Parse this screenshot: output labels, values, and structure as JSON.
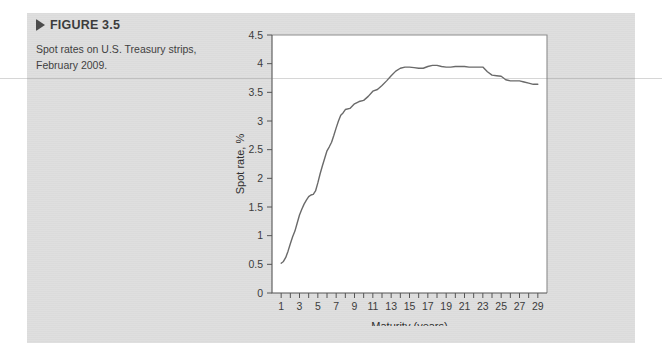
{
  "figure": {
    "marker_icon": "triangle-right-icon",
    "label": "FIGURE 3.5",
    "caption": "Spot rates on U.S. Treasury strips, February 2009."
  },
  "colors": {
    "panel_background": "#dedede",
    "page_background": "#ffffff",
    "plot_background": "#ffffff",
    "line_color": "#6a6a6a",
    "axis_color": "#555555",
    "frame_color": "#8d8d8d",
    "text_color": "#3c3c3c",
    "heading_color": "#3c3c3c"
  },
  "chart_data": {
    "type": "line",
    "title": "",
    "xlabel": "Maturity (years)",
    "ylabel": "Spot rate, %",
    "xlim": [
      0,
      30
    ],
    "ylim": [
      0,
      4.5
    ],
    "ytick_values": [
      0,
      0.5,
      1,
      1.5,
      2,
      2.5,
      3,
      3.5,
      4,
      4.5
    ],
    "ytick_labels": [
      "0",
      "0.5",
      "1",
      "1.5",
      "2",
      "2.5",
      "3",
      "3.5",
      "4",
      "4.5"
    ],
    "xtick_values": [
      1,
      2,
      3,
      4,
      5,
      6,
      7,
      8,
      9,
      10,
      11,
      12,
      13,
      14,
      15,
      16,
      17,
      18,
      19,
      20,
      21,
      22,
      23,
      24,
      25,
      26,
      27,
      28,
      29
    ],
    "xtick_labels": [
      "1",
      "",
      "3",
      "",
      "5",
      "",
      "7",
      "",
      "9",
      "",
      "11",
      "",
      "13",
      "",
      "15",
      "",
      "17",
      "",
      "19",
      "",
      "21",
      "",
      "23",
      "",
      "25",
      "",
      "27",
      "",
      "29"
    ],
    "xtick_labeled_values": [
      1,
      3,
      5,
      7,
      9,
      11,
      13,
      15,
      17,
      19,
      21,
      23,
      25,
      27,
      29
    ],
    "grid": false,
    "legend": "none",
    "series": [
      {
        "name": "U.S. Treasury strip spot rates, February 2009",
        "x": [
          1,
          1.25,
          1.5,
          1.75,
          2,
          2.25,
          2.5,
          2.75,
          3,
          3.25,
          3.5,
          3.75,
          4,
          4.25,
          4.5,
          4.75,
          5,
          5.25,
          5.5,
          5.75,
          6,
          6.25,
          6.5,
          6.75,
          7,
          7.25,
          7.5,
          7.75,
          8,
          8.5,
          9,
          9.5,
          10,
          10.5,
          11,
          11.5,
          12,
          12.5,
          13,
          13.5,
          14,
          14.5,
          15,
          15.5,
          16,
          16.5,
          17,
          17.5,
          18,
          18.5,
          19,
          19.5,
          20,
          20.5,
          21,
          21.5,
          22,
          22.5,
          23,
          23.5,
          24,
          24.5,
          25,
          25.5,
          26,
          26.5,
          27,
          27.5,
          28,
          28.5,
          29
        ],
        "y": [
          0.52,
          0.55,
          0.62,
          0.73,
          0.86,
          0.98,
          1.08,
          1.22,
          1.36,
          1.46,
          1.55,
          1.62,
          1.68,
          1.71,
          1.72,
          1.78,
          1.92,
          2.08,
          2.22,
          2.35,
          2.48,
          2.55,
          2.63,
          2.75,
          2.88,
          3.0,
          3.1,
          3.14,
          3.2,
          3.22,
          3.3,
          3.34,
          3.36,
          3.43,
          3.52,
          3.55,
          3.62,
          3.7,
          3.79,
          3.87,
          3.92,
          3.94,
          3.94,
          3.93,
          3.92,
          3.92,
          3.95,
          3.97,
          3.97,
          3.95,
          3.94,
          3.94,
          3.95,
          3.95,
          3.95,
          3.94,
          3.94,
          3.94,
          3.94,
          3.86,
          3.8,
          3.79,
          3.78,
          3.72,
          3.7,
          3.7,
          3.7,
          3.68,
          3.66,
          3.64,
          3.64
        ]
      }
    ]
  }
}
